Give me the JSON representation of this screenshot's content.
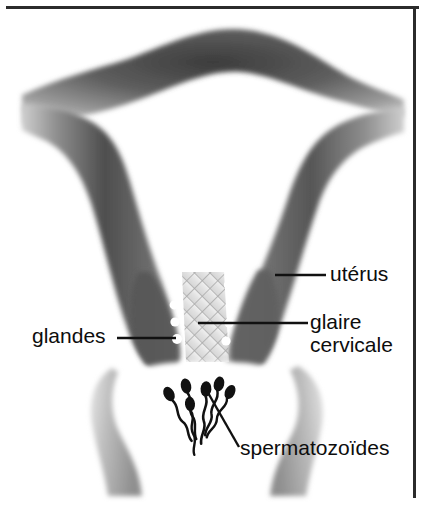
{
  "figure": {
    "width": 425,
    "height": 505,
    "style": "airbrush grayscale medical illustration",
    "border": {
      "name": "frame-border",
      "sides": [
        "top",
        "right"
      ],
      "color": "#2b2b2b",
      "thickness": 3
    },
    "palette": {
      "background": "#ffffff",
      "cavity": "#ffffff",
      "wall_dark": "#4a4a4a",
      "wall_mid": "#8d8d8d",
      "wall_light": "#d2d2d2",
      "mucus_mesh": "#b9b9b9",
      "gland_dot": "#ffffff",
      "sperm": "#111111",
      "text": "#0d0d0d",
      "leader_line": "#111111"
    }
  },
  "labels": {
    "uterus": {
      "text": "utérus",
      "leader": {
        "x1": 275,
        "y1": 275,
        "x2": 326,
        "y2": 275
      }
    },
    "glaire": {
      "line1": "glaire",
      "line2": "cervicale",
      "leader": {
        "x1": 198,
        "y1": 323,
        "x2": 308,
        "y2": 323
      }
    },
    "glandes": {
      "text": "glandes",
      "leader": {
        "x1": 117,
        "y1": 338,
        "x2": 176,
        "y2": 338
      }
    },
    "spermatozoides": {
      "text": "spermatozoïdes",
      "leader": {
        "x1": 207,
        "y1": 391,
        "x2": 239,
        "y2": 447
      }
    }
  },
  "anatomy": {
    "parts": [
      {
        "name": "fundus",
        "label": "fond utérin"
      },
      {
        "name": "uterine-cavity",
        "label": "cavité utérine"
      },
      {
        "name": "left-uterine-wall",
        "label": "paroi utérine gauche"
      },
      {
        "name": "right-uterine-wall",
        "label": "paroi utérine droite"
      },
      {
        "name": "cervical-canal",
        "label": "canal cervical"
      },
      {
        "name": "cervical-mucus",
        "label": "glaire cervicale"
      },
      {
        "name": "vaginal-vault",
        "label": "cul-de-sac vaginal"
      }
    ],
    "glands": {
      "count": 8,
      "left_dots": [
        {
          "cx": 176,
          "cy": 287,
          "r": 4.2
        },
        {
          "cx": 174,
          "cy": 305,
          "r": 4.4
        },
        {
          "cx": 175,
          "cy": 322,
          "r": 4.6
        },
        {
          "cx": 177,
          "cy": 339,
          "r": 5.0
        }
      ],
      "right_dots": [
        {
          "cx": 228,
          "cy": 285,
          "r": 4.2
        },
        {
          "cx": 230,
          "cy": 305,
          "r": 4.4
        },
        {
          "cx": 229,
          "cy": 323,
          "r": 4.6
        },
        {
          "cx": 226,
          "cy": 341,
          "r": 4.6
        }
      ]
    },
    "mucus_mesh": {
      "pattern": "diagonal cross-hatch lattice",
      "spacing": 11,
      "angle_deg": 45
    },
    "spermatozoa": {
      "count": 6,
      "cells": [
        {
          "hx": 169,
          "hy": 394,
          "rot": -28
        },
        {
          "hx": 186,
          "hy": 386,
          "rot": -12
        },
        {
          "hx": 190,
          "hy": 403,
          "rot": -6
        },
        {
          "hx": 206,
          "hy": 389,
          "rot": 4
        },
        {
          "hx": 218,
          "hy": 384,
          "rot": 14
        },
        {
          "hx": 229,
          "hy": 392,
          "rot": 26
        }
      ]
    }
  }
}
